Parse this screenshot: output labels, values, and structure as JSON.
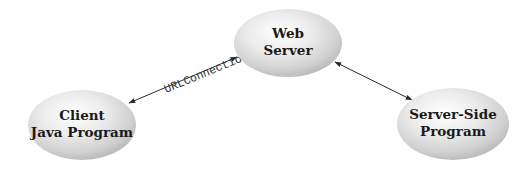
{
  "diagram": {
    "title": "",
    "nodes": [
      {
        "id": "web-server",
        "line1": "Web",
        "line2": "Server",
        "cx": 288,
        "cy": 43,
        "rx": 54,
        "ry": 34
      },
      {
        "id": "client",
        "line1": "Client",
        "line2": "Java Program",
        "cx": 82,
        "cy": 125,
        "rx": 54,
        "ry": 35
      },
      {
        "id": "server-side",
        "line1": "Server-Side",
        "line2": "Program",
        "cx": 453,
        "cy": 124,
        "rx": 56,
        "ry": 36
      }
    ],
    "edges": [
      {
        "id": "client-web",
        "from": "client",
        "to": "web-server",
        "label": "URLConnection",
        "bidirectional": true
      },
      {
        "id": "web-serverside",
        "from": "web-server",
        "to": "server-side",
        "label": "",
        "bidirectional": true
      }
    ],
    "colors": {
      "background": "#ffffff",
      "ellipse_highlight": "#ffffff",
      "ellipse_mid": "#e4e4e4",
      "ellipse_edge": "#b9b9b9",
      "arrow": "#2a2a2a",
      "text": "#1a1a1a"
    }
  }
}
